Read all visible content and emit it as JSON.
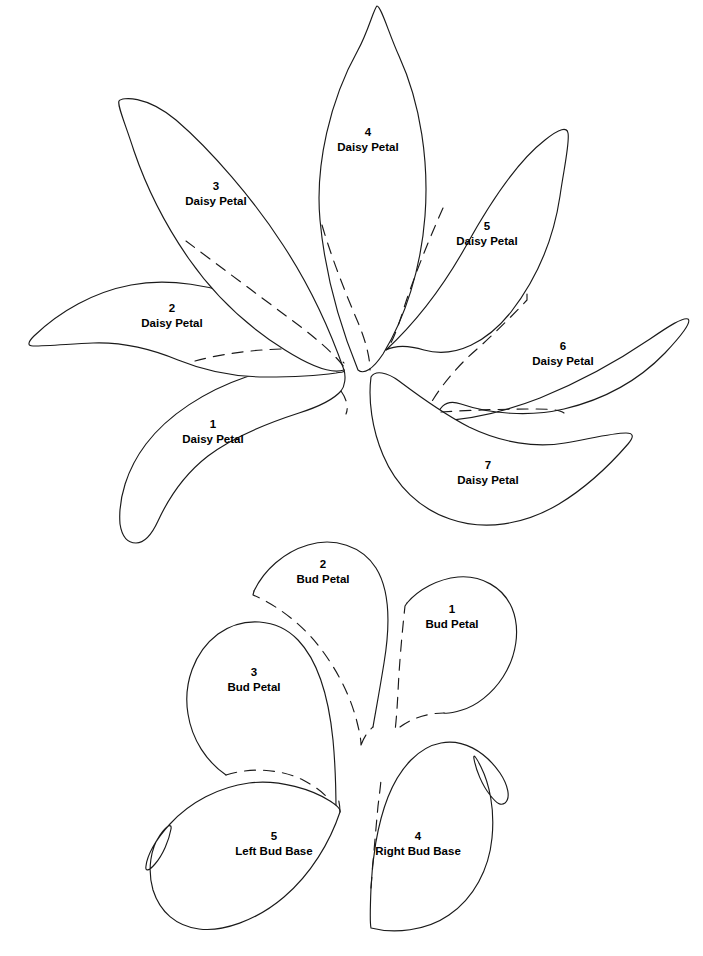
{
  "sheet": {
    "title": "Daisy and Bud Applique Pattern Pieces",
    "background_color": "#ffffff",
    "line_color": "#1a1a1a"
  },
  "groups": [
    {
      "name": "daisy-flower-group",
      "label": "Daisy"
    },
    {
      "name": "bud-group",
      "label": "Bud"
    }
  ],
  "pieces": [
    {
      "id": "daisy-petal-1",
      "number": "1",
      "name": "Daisy Petal",
      "group": "daisy",
      "label_x": 213,
      "label_y": 428,
      "outline": "M 344 370 C 316 364 278 366 246 377 C 205 391 168 415 146 444 C 127 469 118 499 120 524 C 122 537 128 543 136 543 C 145 543 152 534 158 521 C 170 495 186 473 208 456 C 233 437 265 424 299 413 C 321 406 334 399 341 391 C 345 386 346 377 344 370 Z",
      "hidden_edge": "M 341 391 C 346 398 349 407 346 414"
    },
    {
      "id": "daisy-petal-2",
      "number": "2",
      "name": "Daisy Petal",
      "group": "daisy",
      "label_x": 172,
      "label_y": 312,
      "outline": "M 344 370 C 322 343 292 320 255 303 C 213 284 167 278 131 285 C 94 292 60 311 34 336 C 28 342 27 346 33 346 C 48 346 70 344 93 343 C 120 342 149 348 178 360 C 205 371 231 377 266 377 C 297 377 322 375 336 373 C 342 372 345 372 344 370 Z",
      "hidden_edge": "M 195 361 C 228 352 268 348 305 349 C 325 350 338 356 344 363"
    },
    {
      "id": "daisy-petal-3",
      "number": "3",
      "name": "Daisy Petal",
      "group": "daisy",
      "label_x": 216,
      "label_y": 190,
      "outline": "M 344 370 C 330 330 310 286 283 245 C 254 200 211 150 176 120 C 146 95 122 97 119 101 C 117 105 125 123 134 151 C 147 189 166 226 189 259 C 212 292 245 325 285 350 C 312 367 332 374 344 370 Z",
      "hidden_edge": "M 186 241 C 218 265 258 295 293 321 C 320 341 337 357 344 367"
    },
    {
      "id": "daisy-petal-4",
      "number": "4",
      "name": "Daisy Petal",
      "group": "daisy",
      "label_x": 368,
      "label_y": 136,
      "outline": "M 358 370 C 340 326 325 274 320 220 C 315 165 330 100 358 50 C 368 32 374 8 377 6 C 381 6 389 34 399 56 C 421 104 429 163 425 216 C 421 269 405 318 383 354 C 373 369 364 375 358 370 Z",
      "hidden_edge": "M 322 225 C 331 256 345 292 357 320 C 366 341 370 358 370 370"
    },
    {
      "id": "daisy-petal-5",
      "number": "5",
      "name": "Daisy Petal",
      "group": "daisy",
      "label_x": 487,
      "label_y": 230,
      "outline": "M 386 350 C 414 324 443 287 466 246 C 492 199 519 160 545 140 C 560 128 567 127 568 133 C 570 142 564 168 560 196 C 553 243 535 281 511 312 C 488 341 456 359 424 350 C 404 344 392 347 386 350 Z",
      "hidden_edge": "M 443 208 C 427 244 412 282 403 311 C 396 333 391 345 386 350"
    },
    {
      "id": "daisy-petal-6",
      "number": "6",
      "name": "Daisy Petal",
      "group": "daisy",
      "label_x": 563,
      "label_y": 350,
      "outline": "M 437 421 C 467 420 504 412 540 398 C 582 381 622 358 650 339 C 669 326 683 317 688 319 C 692 322 681 336 665 353 C 638 381 602 400 564 409 C 530 417 490 414 461 404 C 444 398 437 410 437 421 Z",
      "hidden_edge": "M 527 294 L 527 300 C 512 316 494 334 476 350 C 455 368 438 390 428 408 C 424 416 424 420 437 421"
    },
    {
      "id": "daisy-petal-7",
      "number": "7",
      "name": "Daisy Petal",
      "group": "daisy",
      "label_x": 488,
      "label_y": 469,
      "outline": "M 371 377 C 368 400 372 429 383 455 C 396 486 420 509 450 519 C 484 531 524 525 559 504 C 592 484 615 459 628 444 C 634 437 634 433 626 433 C 612 433 589 439 565 443 C 536 448 502 443 469 427 C 440 412 415 393 399 381 C 387 372 375 370 371 377 Z",
      "hidden_edge": "M 441 412 C 470 410 507 409 534 409 C 551 409 560 410 564 413"
    },
    {
      "id": "bud-petal-1",
      "number": "1",
      "name": "Bud Petal",
      "group": "bud",
      "label_x": 452,
      "label_y": 613,
      "outline": "M 407 603 C 419 589 438 579 458 577 C 481 575 503 587 512 608 C 521 630 516 657 503 677 C 492 694 476 706 462 710 C 452 713 447 714 444 713",
      "hidden_edge": "M 407 603 L 405 606 C 402 633 399 668 398 692 C 397 711 396 723 395 731 M 400 727 C 412 718 428 713 444 713"
    },
    {
      "id": "bud-petal-2",
      "number": "2",
      "name": "Bud Petal",
      "group": "bud",
      "label_x": 323,
      "label_y": 568,
      "outline": "M 254 591 C 264 570 284 552 308 545 C 334 537 362 546 376 568 C 391 592 390 627 384 663 C 379 694 375 715 373 727",
      "hidden_edge": "M 254 591 L 253 595 C 277 605 305 626 324 653 C 342 678 352 702 357 722 C 360 734 361 740 361 745 M 361 745 C 364 737 368 731 373 727"
    },
    {
      "id": "bud-petal-3",
      "number": "3",
      "name": "Bud Petal",
      "group": "bud",
      "label_x": 254,
      "label_y": 676,
      "outline": "M 226 775 C 207 762 192 740 188 714 C 183 684 194 652 218 634 C 243 616 277 618 298 640 C 320 663 329 700 333 740 C 336 772 336 795 336 812",
      "hidden_edge": "M 226 775 C 251 767 281 769 303 780 C 324 791 333 802 336 812"
    },
    {
      "id": "bud-base-4",
      "number": "4",
      "name": "Right Bud Base",
      "group": "bud",
      "label_x": 418,
      "label_y": 853,
      "outline": "M 371 928 C 394 934 426 931 449 915 C 474 898 489 869 492 838 C 495 808 489 783 481 767 C 476 757 473 753 474 759 C 476 770 482 785 490 795 C 497 804 501 806 505 803 C 511 798 508 785 500 773 C 484 750 462 739 441 743 C 419 747 400 767 388 797 C 377 825 372 861 371 888 C 370 912 370 924 371 928 Z",
      "hidden_edge": "M 371 888 C 373 861 376 828 378 806 C 380 790 381 782 381 778"
    },
    {
      "id": "bud-base-5",
      "number": "5",
      "name": "Left Bud Base",
      "group": "bud",
      "label_x": 274,
      "label_y": 853,
      "outline": "M 340 812 C 330 842 311 874 284 897 C 256 921 222 932 199 929 C 176 926 160 912 153 890 C 147 869 151 848 160 835 C 167 825 172 823 171 829 C 169 840 163 855 155 864 C 149 871 145 872 146 866 C 147 856 155 840 170 824 C 190 802 219 787 249 783 C 280 779 313 790 330 801 C 338 806 341 809 340 812 Z",
      "hidden_edge": "M 340 812 C 340 806 339 800 337 795"
    }
  ]
}
